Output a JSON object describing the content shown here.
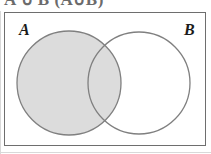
{
  "figure": {
    "type": "venn-diagram",
    "caption_fragment": "A ∪ B (A∪B)",
    "universe_label": "",
    "background_color": "#ffffff",
    "frame_color": "#6e6e6e",
    "circle_outline_color": "#808080",
    "shaded_fill_color": "#dcdcdc",
    "unshaded_fill_color": "#ffffff",
    "label_color": "#1b1b1b"
  },
  "sets": [
    {
      "id": "A",
      "label": "A",
      "shaded": true,
      "cx": 69,
      "cy": 83,
      "r": 52
    },
    {
      "id": "B",
      "label": "B",
      "shaded": false,
      "cx": 139,
      "cy": 83,
      "r": 51
    }
  ],
  "regions": {
    "a_only": "shaded",
    "intersection": "shaded",
    "b_only": "unshaded",
    "outside": "unshaded"
  },
  "frame": {
    "x": 4,
    "y": 12,
    "width": 202,
    "height": 134
  }
}
